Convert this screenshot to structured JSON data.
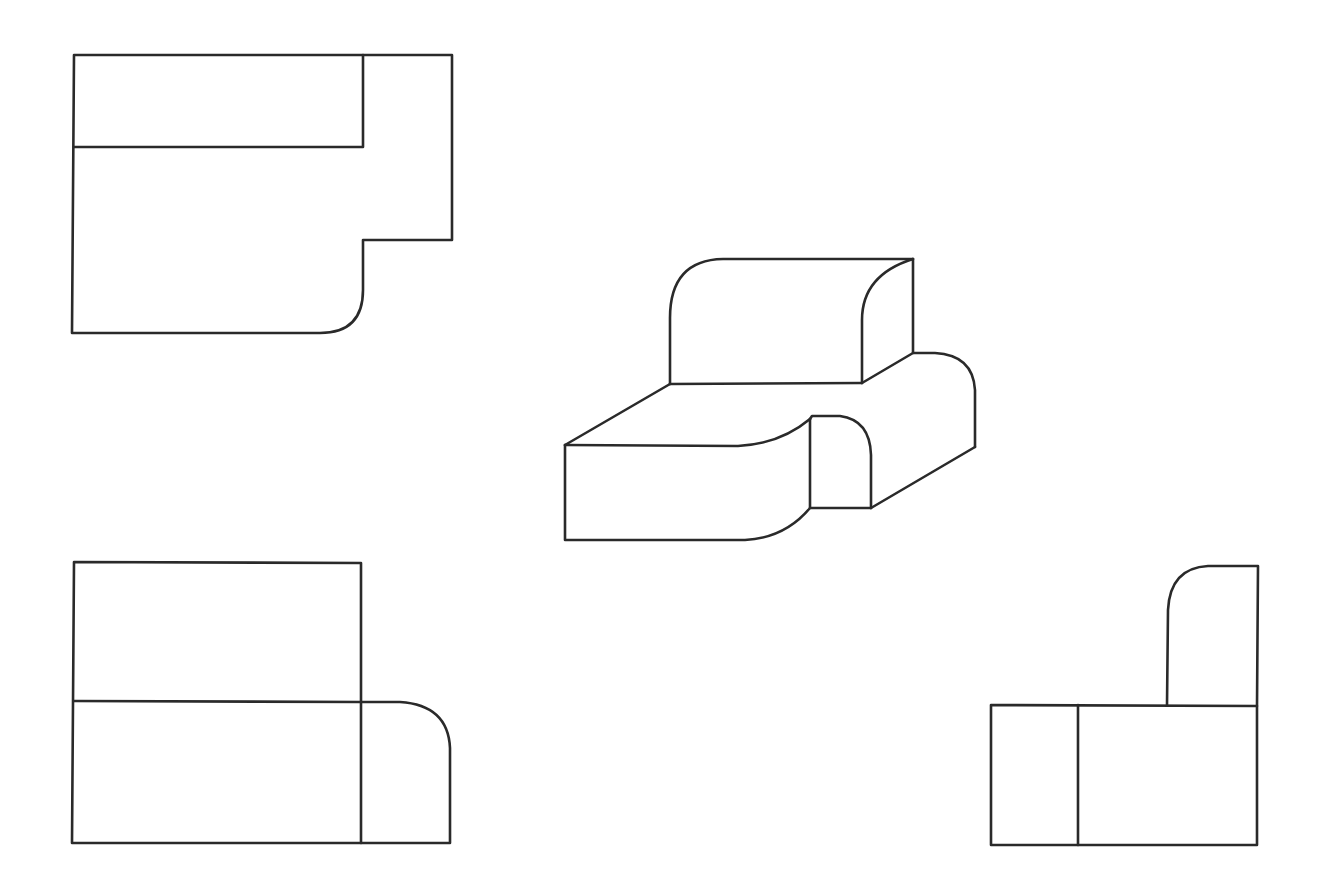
{
  "diagram": {
    "type": "orthographic-projection",
    "background": "#ffffff",
    "stroke_color": "#2a2a2a",
    "views": [
      {
        "id": "top-view",
        "label": "Top view",
        "position": "top-left"
      },
      {
        "id": "isometric-view",
        "label": "Isometric view",
        "position": "center"
      },
      {
        "id": "front-view",
        "label": "Front view",
        "position": "bottom-left"
      },
      {
        "id": "side-view",
        "label": "Side view",
        "position": "bottom-right"
      }
    ]
  }
}
